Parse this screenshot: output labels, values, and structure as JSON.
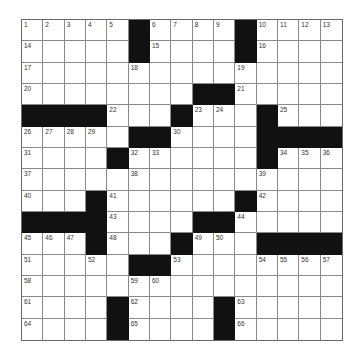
{
  "puzzle": {
    "rows": 15,
    "cols": 15,
    "colors": {
      "block": "#111111",
      "line": "#8a8a8a",
      "background": "#ffffff"
    },
    "grid": [
      [
        "1",
        "2",
        "3",
        "4",
        "5",
        "#",
        "6",
        "7",
        "8",
        "9",
        "#",
        "10",
        "11",
        "12",
        "13"
      ],
      [
        "14",
        "",
        "",
        "",
        "",
        "#",
        "15",
        "",
        "",
        "",
        "#",
        "16",
        "",
        "",
        ""
      ],
      [
        "17",
        "",
        "",
        "",
        "",
        "18",
        "",
        "",
        "",
        "",
        "19",
        "",
        "",
        "",
        ""
      ],
      [
        "20",
        "",
        "",
        "",
        "",
        "",
        "",
        "",
        "#",
        "#",
        "21",
        "",
        "",
        "",
        ""
      ],
      [
        "#",
        "#",
        "#",
        "#",
        "22",
        "",
        "",
        "#",
        "23",
        "24",
        "",
        "#",
        "25",
        "",
        ""
      ],
      [
        "26",
        "27",
        "28",
        "29",
        "",
        "#",
        "#",
        "30",
        "",
        "",
        "",
        "#",
        "#",
        "#",
        "#"
      ],
      [
        "31",
        "",
        "",
        "",
        "#",
        "32",
        "33",
        "",
        "",
        "",
        "",
        "#",
        "34",
        "35",
        "36"
      ],
      [
        "37",
        "",
        "",
        "",
        "",
        "38",
        "",
        "",
        "",
        "",
        "",
        "39",
        "",
        "",
        ""
      ],
      [
        "40",
        "",
        "",
        "#",
        "41",
        "",
        "",
        "",
        "",
        "",
        "#",
        "42",
        "",
        "",
        ""
      ],
      [
        "#",
        "#",
        "#",
        "#",
        "43",
        "",
        "",
        "",
        "#",
        "#",
        "44",
        "",
        "",
        "",
        ""
      ],
      [
        "45",
        "46",
        "47",
        "#",
        "48",
        "",
        "",
        "#",
        "49",
        "50",
        "",
        "#",
        "#",
        "#",
        "#"
      ],
      [
        "51",
        "",
        "",
        "52",
        "",
        "#",
        "#",
        "53",
        "",
        "",
        "",
        "54",
        "55",
        "56",
        "57"
      ],
      [
        "58",
        "",
        "",
        "",
        "",
        "59",
        "60",
        "",
        "",
        "",
        "",
        "",
        "",
        "",
        ""
      ],
      [
        "61",
        "",
        "",
        "",
        "#",
        "62",
        "",
        "",
        "",
        "#",
        "63",
        "",
        "",
        "",
        ""
      ],
      [
        "64",
        "",
        "",
        "",
        "#",
        "65",
        "",
        "",
        "",
        "#",
        "66",
        "",
        "",
        "",
        ""
      ]
    ]
  }
}
